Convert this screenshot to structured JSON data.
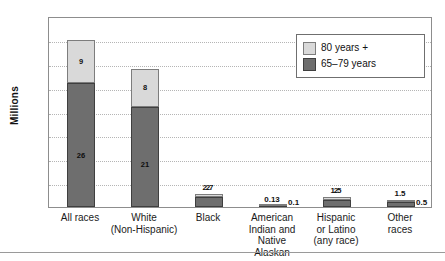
{
  "chart_data": {
    "type": "bar",
    "subtype": "stacked-vertical",
    "title": "",
    "xlabel": "",
    "ylabel": "Millions",
    "ylim": [
      0,
      40
    ],
    "ytick_step": 5,
    "yticks": [
      "40",
      "35",
      "30",
      "25",
      "20",
      "15",
      "10",
      "5",
      "0"
    ],
    "grid": "horizontal-dotted",
    "legend_position": "top-right",
    "categories": [
      "All races",
      "White (Non-Hispanic)",
      "Black",
      "American Indian and Native Alaskan",
      "Hispanic or Latino (any race)",
      "Other races"
    ],
    "category_lines": [
      [
        "All races"
      ],
      [
        "White",
        "(Non-Hispanic)"
      ],
      [
        "Black"
      ],
      [
        "American",
        "Indian and",
        "Native",
        "Alaskan"
      ],
      [
        "Hispanic",
        "or Latino",
        "(any race)"
      ],
      [
        "Other",
        "races"
      ]
    ],
    "series": [
      {
        "name": "65–79 years",
        "color": "#6e6e6e",
        "values": [
          26,
          21,
          2,
          0.13,
          1.5,
          1.0
        ],
        "labels": [
          "26",
          "21",
          "2",
          "0.13",
          "1.5",
          ""
        ]
      },
      {
        "name": "80 years +",
        "color": "#d9d9d9",
        "values": [
          9,
          8,
          0.7,
          0.1,
          0.5,
          0.5
        ],
        "labels": [
          "9",
          "8",
          "",
          "0.1",
          "",
          "0.5"
        ]
      }
    ],
    "totals": [
      35,
      29,
      2.7,
      0.23,
      2,
      1.5
    ],
    "total_labels": [
      "",
      "",
      "2.7",
      "",
      "2",
      "1.5"
    ]
  },
  "legend": {
    "items": [
      {
        "label": "80 years +",
        "swatch": "old"
      },
      {
        "label": "65–79 years",
        "swatch": "young"
      }
    ]
  },
  "axis": {
    "y_title": "Millions"
  }
}
